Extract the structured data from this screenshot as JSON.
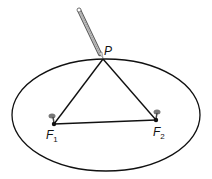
{
  "diagram": {
    "labels": {
      "point": "P",
      "focus1_main": "F",
      "focus1_sub": "1",
      "focus2_main": "F",
      "focus2_sub": "2"
    },
    "colors": {
      "stroke": "#111111",
      "pencil": "#9a9a9a",
      "pin": "#777777",
      "background": "#ffffff"
    }
  }
}
